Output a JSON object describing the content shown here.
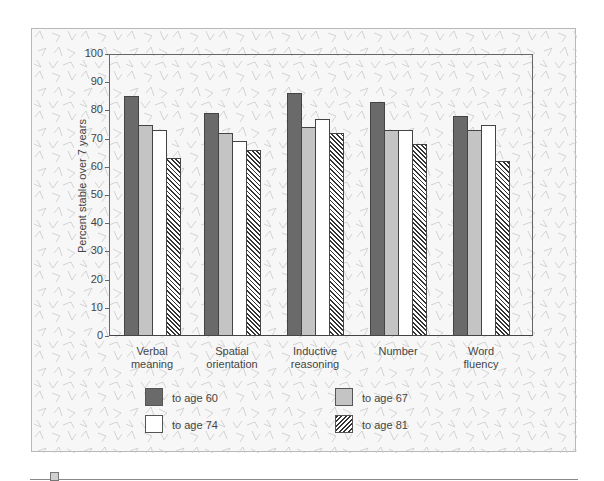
{
  "chart_data": {
    "type": "bar",
    "title": "",
    "xlabel": "",
    "ylabel": "Percent stable over 7 years",
    "ylim": [
      0,
      100
    ],
    "yticks": [
      0,
      10,
      20,
      30,
      40,
      50,
      60,
      70,
      80,
      90,
      100
    ],
    "grid": false,
    "legend_position": "bottom",
    "categories": [
      "Verbal meaning",
      "Spatial orientation",
      "Inductive reasoning",
      "Number",
      "Word fluency"
    ],
    "category_lines": [
      [
        "Verbal",
        "meaning"
      ],
      [
        "Spatial",
        "orientation"
      ],
      [
        "Inductive",
        "reasoning"
      ],
      [
        "Number"
      ],
      [
        "Word",
        "fluency"
      ]
    ],
    "series": [
      {
        "name": "to age 60",
        "fill": "dark gray",
        "color": "#6a6a6a",
        "values": [
          85,
          79,
          86,
          83,
          78
        ]
      },
      {
        "name": "to age 67",
        "fill": "light gray",
        "color": "#c4c4c4",
        "values": [
          75,
          72,
          74,
          73,
          73
        ]
      },
      {
        "name": "to age 74",
        "fill": "white",
        "color": "#ffffff",
        "values": [
          73,
          69,
          77,
          73,
          75
        ]
      },
      {
        "name": "to age 81",
        "fill": "hatched",
        "color": "#333333",
        "values": [
          63,
          66,
          72,
          68,
          62
        ]
      }
    ]
  },
  "legend": {
    "items": [
      {
        "label": "to age 60"
      },
      {
        "label": "to age 67"
      },
      {
        "label": "to age 74"
      },
      {
        "label": "to age 81"
      }
    ]
  }
}
